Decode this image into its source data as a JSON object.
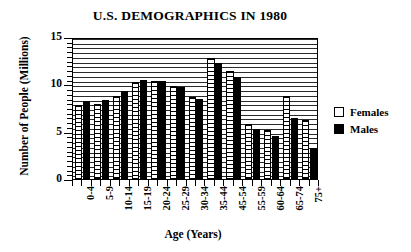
{
  "chart_data": {
    "type": "bar",
    "title": "U.S. DEMOGRAPHICS IN 1980",
    "xlabel": "Age (Years)",
    "ylabel": "Number of People (Millions)",
    "categories": [
      "0-4",
      "5-9",
      "10-14",
      "15-19",
      "20-24",
      "25-29",
      "30-34",
      "35-44",
      "45-54",
      "55-59",
      "60-64",
      "65-74",
      "75+"
    ],
    "series": [
      {
        "name": "Females",
        "color": "#ffffff",
        "values": [
          7.8,
          7.9,
          8.8,
          10.2,
          10.4,
          9.8,
          8.7,
          12.8,
          11.4,
          5.8,
          5.2,
          8.8,
          6.2
        ]
      },
      {
        "name": "Males",
        "color": "#000000",
        "values": [
          8.2,
          8.3,
          9.3,
          10.5,
          10.4,
          9.7,
          8.5,
          12.3,
          10.8,
          5.3,
          4.5,
          6.4,
          3.3
        ]
      }
    ],
    "ylim": [
      0,
      15
    ],
    "ytick_labels": [
      "0",
      "5",
      "10",
      "15"
    ],
    "ytick_values": [
      0,
      5,
      10,
      15
    ],
    "yminor_step": 0.5,
    "grid": true,
    "grid_axis": "y",
    "legend_position": "right",
    "legend": [
      "Females",
      "Males"
    ]
  }
}
